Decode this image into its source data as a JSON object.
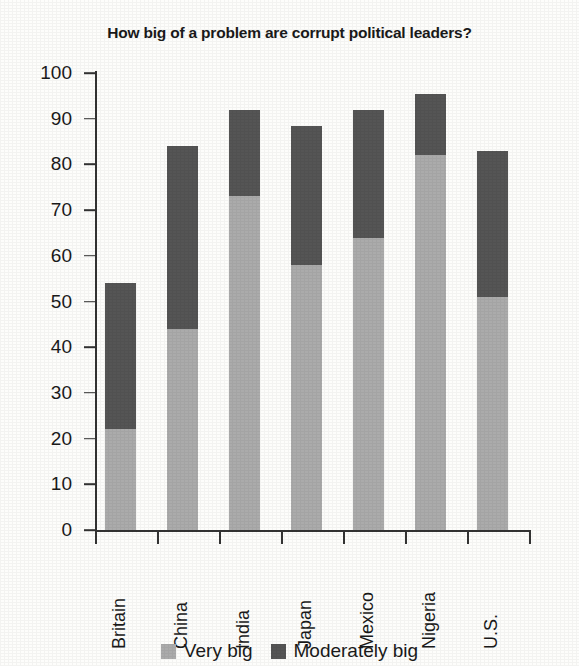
{
  "chart_data": {
    "type": "bar",
    "subtype": "stacked-vertical",
    "title": "How big of a problem are corrupt political leaders?",
    "xlabel": "",
    "ylabel": "",
    "ylim": [
      0,
      100
    ],
    "ytick_step": 10,
    "ytick_labels": [
      "100",
      "90",
      "80",
      "70",
      "60",
      "50",
      "40",
      "30",
      "20",
      "10",
      "0"
    ],
    "ytick_values": [
      100,
      90,
      80,
      70,
      60,
      50,
      40,
      30,
      20,
      10,
      0
    ],
    "grid": false,
    "legend_position": "bottom-center",
    "categories": [
      "Britain",
      "China",
      "India",
      "Japan",
      "Mexico",
      "Nigeria",
      "U.S."
    ],
    "series": [
      {
        "name": "Very big",
        "color": "#ababab",
        "values": [
          22,
          44,
          73,
          58,
          64,
          82,
          51
        ]
      },
      {
        "name": "Moderately big",
        "color": "#555555",
        "values": [
          32,
          40,
          19,
          30.5,
          28,
          13.5,
          32
        ]
      }
    ],
    "totals": [
      54,
      84,
      92,
      88.5,
      92,
      95.5,
      83
    ]
  },
  "legend": {
    "items": [
      {
        "label": "Very big",
        "swatch_name": "legend-swatch-very-big"
      },
      {
        "label": "Moderately big",
        "swatch_name": "legend-swatch-moderately-big"
      }
    ]
  },
  "colors": {
    "very_big": "#ababab",
    "moderately_big": "#555555",
    "axis": "#333333",
    "text": "#1a1a1a",
    "background": "#fdfdfb"
  }
}
